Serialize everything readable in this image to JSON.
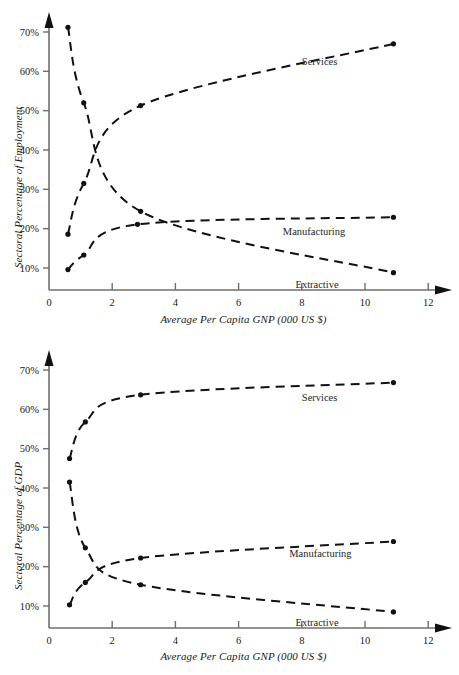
{
  "figure": {
    "background": "#ffffff",
    "line_color": "#111111",
    "axis_color": "#6e6e6e",
    "panels": [
      "employment",
      "gdp"
    ]
  },
  "common": {
    "xlabel": "Average Per Capita GNP (000 US $)",
    "x_ticks": [
      "0",
      "2",
      "4",
      "6",
      "8",
      "10",
      "12"
    ],
    "y_ticks": [
      "10%",
      "20%",
      "30%",
      "40%",
      "50%",
      "60%",
      "70%"
    ],
    "series_labels": {
      "services": "Services",
      "manufacturing": "Manufacturing",
      "extractive": "Extractive"
    }
  },
  "chart_data": [
    {
      "type": "line",
      "title": "",
      "panel_id": "employment",
      "xlabel": "Average Per Capita GNP (000 US $)",
      "ylabel": "Sectoral Percentage of Employment",
      "xlim": [
        0,
        13
      ],
      "ylim": [
        0,
        75
      ],
      "xticks": [
        0,
        2,
        4,
        6,
        8,
        10,
        12
      ],
      "yticks": [
        10,
        20,
        30,
        40,
        50,
        60,
        70
      ],
      "ytick_labels": [
        "10%",
        "20%",
        "30%",
        "40%",
        "50%",
        "60%",
        "70%"
      ],
      "grid": false,
      "legend": "inline-annotations",
      "linestyle": "dashed",
      "marker": "filled-circle",
      "series": [
        {
          "name": "Services",
          "label_position": {
            "x": 8.0,
            "y": 61.5
          },
          "x": [
            0.6,
            1.1,
            2.9,
            10.9
          ],
          "values": [
            18.6,
            31.5,
            51.3,
            67.0
          ]
        },
        {
          "name": "Manufacturing",
          "label_position": {
            "x": 7.4,
            "y": 18.5
          },
          "x": [
            0.6,
            1.1,
            2.8,
            10.9
          ],
          "values": [
            9.6,
            13.3,
            21.1,
            22.9
          ]
        },
        {
          "name": "Extractive",
          "label_position": {
            "x": 7.8,
            "y": 5.0
          },
          "x": [
            0.6,
            1.1,
            2.9,
            10.9
          ],
          "values": [
            71.2,
            52.0,
            24.4,
            8.8
          ]
        }
      ]
    },
    {
      "type": "line",
      "title": "",
      "panel_id": "gdp",
      "xlabel": "Average Per Capita GNP (000 US $)",
      "ylabel": "Sectoral Percentage of GDP",
      "xlim": [
        0,
        13
      ],
      "ylim": [
        0,
        75
      ],
      "xticks": [
        0,
        2,
        4,
        6,
        8,
        10,
        12
      ],
      "yticks": [
        10,
        20,
        30,
        40,
        50,
        60,
        70
      ],
      "ytick_labels": [
        "10%",
        "20%",
        "30%",
        "40%",
        "50%",
        "60%",
        "70%"
      ],
      "grid": false,
      "legend": "inline-annotations",
      "linestyle": "dashed",
      "marker": "filled-circle",
      "series": [
        {
          "name": "Services",
          "label_position": {
            "x": 8.0,
            "y": 62.0
          },
          "x": [
            0.65,
            1.15,
            2.9,
            10.9
          ],
          "values": [
            47.5,
            56.8,
            63.7,
            66.8
          ]
        },
        {
          "name": "Manufacturing",
          "label_position": {
            "x": 7.6,
            "y": 22.5
          },
          "x": [
            0.65,
            1.15,
            2.9,
            10.9
          ],
          "values": [
            10.3,
            16.0,
            22.2,
            26.4
          ]
        },
        {
          "name": "Extractive",
          "label_position": {
            "x": 7.8,
            "y": 5.0
          },
          "x": [
            0.65,
            1.15,
            2.9,
            10.9
          ],
          "values": [
            41.5,
            24.8,
            15.4,
            8.5
          ]
        }
      ]
    }
  ]
}
